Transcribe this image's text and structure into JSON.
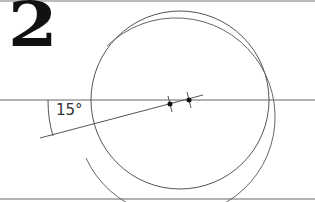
{
  "figure": {
    "step_number": "2",
    "angle_label": "15°",
    "colors": {
      "background": "#ffffff",
      "line": "#555555",
      "dark": "#111111"
    }
  },
  "geometry": {
    "horizontal_lines_y": [
      1,
      100,
      199
    ],
    "inner_circle": {
      "cx": 180,
      "cy": 100,
      "r": 89
    },
    "outer_circle_arc": {
      "cx": 190,
      "cy": 99,
      "r": 99,
      "gap": "left side between approx y 72 and y 158"
    },
    "slanted_line": {
      "x1": 40,
      "y1": 138,
      "x2": 202,
      "y2": 96,
      "angle_deg": 15
    },
    "points": [
      {
        "x": 170,
        "y": 104
      },
      {
        "x": 189,
        "y": 100
      }
    ]
  }
}
